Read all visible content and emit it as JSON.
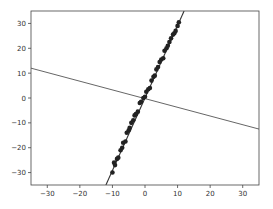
{
  "chart_data": {
    "type": "scatter",
    "title": "",
    "xlabel": "",
    "ylabel": "",
    "xlim": [
      -35,
      35
    ],
    "ylim": [
      -35,
      35
    ],
    "grid": false,
    "legend": null,
    "xticks": [
      -30,
      -20,
      -10,
      0,
      10,
      20,
      30
    ],
    "yticks": [
      -30,
      -20,
      -10,
      0,
      10,
      20,
      30
    ],
    "xtick_labels": [
      "−30",
      "−20",
      "−10",
      "0",
      "10",
      "20",
      "30"
    ],
    "ytick_labels": [
      "−30",
      "−20",
      "−10",
      "0",
      "10",
      "20",
      "30"
    ],
    "series": [
      {
        "name": "points",
        "kind": "scatter",
        "color": "#222222",
        "x": [
          -10.0,
          -9.5,
          -9.2,
          -8.6,
          -8.2,
          -7.5,
          -7.0,
          -6.7,
          -6.0,
          -5.6,
          -5.0,
          -4.7,
          -4.2,
          -3.6,
          -3.2,
          -2.8,
          -2.2,
          -1.6,
          -1.2,
          -0.5,
          0.0,
          0.4,
          1.0,
          1.5,
          2.0,
          2.6,
          3.0,
          3.5,
          4.0,
          4.5,
          5.0,
          5.6,
          6.0,
          6.6,
          7.0,
          7.5,
          8.0,
          8.6,
          9.0,
          9.4,
          10.0,
          10.4
        ],
        "y": [
          -30.0,
          -26.0,
          -27.0,
          -24.5,
          -24.0,
          -21.0,
          -20.0,
          -18.0,
          -17.5,
          -14.0,
          -13.0,
          -12.0,
          -10.0,
          -9.0,
          -7.0,
          -6.5,
          -5.5,
          -2.0,
          -1.5,
          0.0,
          0.5,
          2.5,
          3.5,
          4.0,
          7.0,
          8.5,
          9.0,
          11.5,
          12.5,
          14.5,
          15.5,
          16.0,
          19.0,
          20.0,
          21.0,
          22.5,
          24.0,
          25.5,
          26.0,
          27.0,
          29.0,
          30.5
        ]
      },
      {
        "name": "fit line",
        "kind": "line",
        "color": "#333333",
        "x": [
          -12.0,
          12.0
        ],
        "y": [
          -35.0,
          35.0
        ]
      },
      {
        "name": "perpendicular line",
        "kind": "line",
        "color": "#555555",
        "x": [
          -35.0,
          35.0
        ],
        "y": [
          12.0,
          -12.5
        ]
      }
    ]
  }
}
